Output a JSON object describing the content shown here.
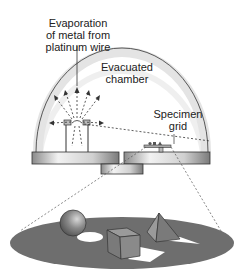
{
  "labels": {
    "evaporation_line1": "Evaporation",
    "evaporation_line2": "of metal from",
    "evaporation_line3": "platinum wire",
    "chamber_line1": "Evacuated",
    "chamber_line2": "chamber",
    "specimen_line1": "Specimen",
    "specimen_line2": "grid"
  },
  "colors": {
    "outline": "#333333",
    "dome_glow": "#e6e6e6",
    "base_metal": "#c8c8c8",
    "disc": "#6e6e6e",
    "shadow": "#ffffff"
  }
}
